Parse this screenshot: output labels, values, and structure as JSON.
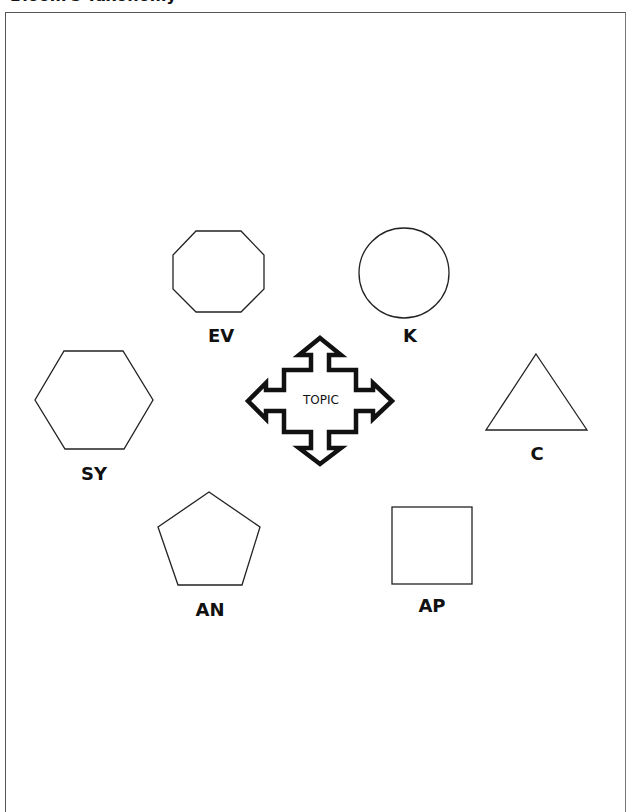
{
  "page": {
    "title": "Bloom's Taxonomy"
  },
  "diagram": {
    "center": {
      "label": "TOPIC",
      "shape": "four-way-arrow"
    },
    "nodes": [
      {
        "id": "ev",
        "label": "EV",
        "shape": "octagon"
      },
      {
        "id": "k",
        "label": "K",
        "shape": "circle"
      },
      {
        "id": "sy",
        "label": "SY",
        "shape": "hexagon"
      },
      {
        "id": "c",
        "label": "C",
        "shape": "triangle"
      },
      {
        "id": "an",
        "label": "AN",
        "shape": "pentagon"
      },
      {
        "id": "ap",
        "label": "AP",
        "shape": "square"
      }
    ],
    "colors": {
      "stroke": "#111111",
      "background": "#ffffff"
    }
  }
}
